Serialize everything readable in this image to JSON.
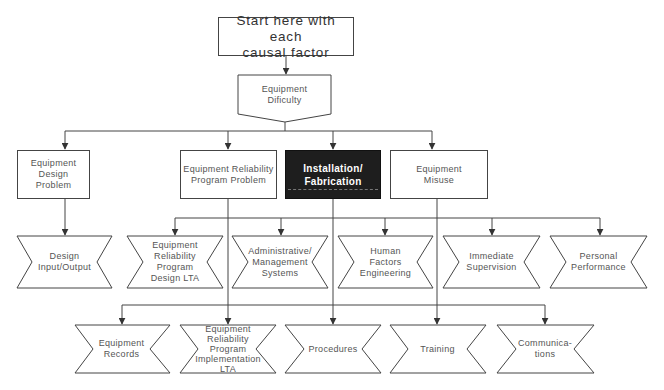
{
  "diagram": {
    "start": {
      "label": "Start here with each\ncausal factor"
    },
    "category": {
      "label": "Equipment\nDificulty"
    },
    "problems": [
      {
        "label": "Equipment Design\nProblem"
      },
      {
        "label": "Equipment Reliability\nProgram Problem"
      },
      {
        "label": "Installation/\nFabrication",
        "highlighted": true
      },
      {
        "label": "Equipment\nMisuse"
      }
    ],
    "causes_row1": [
      {
        "label": "Design\nInput/Output"
      },
      {
        "label": "Equipment\nReliability\nProgram\nDesign  LTA"
      },
      {
        "label": "Administrative/\nManagement\nSystems"
      },
      {
        "label": "Human\nFactors\nEngineering"
      },
      {
        "label": "Immediate\nSupervision"
      },
      {
        "label": "Personal\nPerformance"
      }
    ],
    "causes_row2": [
      {
        "label": "Equipment\nRecords"
      },
      {
        "label": "Equipment\nReliability\nProgram\nImplementation\nLTA"
      },
      {
        "label": "Procedures"
      },
      {
        "label": "Training"
      },
      {
        "label": "Communica-\ntions"
      }
    ],
    "colors": {
      "line": "#444444",
      "highlight_fill": "#1e1e1e",
      "text": "#555555"
    }
  }
}
